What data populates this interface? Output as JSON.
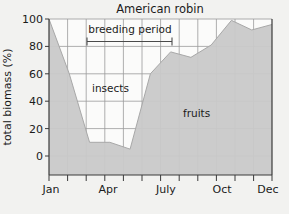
{
  "chart_data": {
    "type": "area",
    "title": "American robin",
    "xlabel": "",
    "ylabel": "total biomass (%)",
    "ylim": [
      0,
      100
    ],
    "yticks": [
      0,
      20,
      40,
      60,
      80,
      100
    ],
    "ytick_labels": [
      "0",
      "20",
      "40",
      "60",
      "80",
      "100"
    ],
    "grid": true,
    "legend_position": "inline-region-labels",
    "categories": [
      "Jan",
      "Feb",
      "Mar",
      "Apr",
      "May",
      "Jun",
      "Jul",
      "Aug",
      "Sep",
      "Oct",
      "Nov",
      "Dec"
    ],
    "xtick_labels": [
      "Jan",
      "Apr",
      "July",
      "Oct",
      "Dec"
    ],
    "xtick_label_months": [
      "Jan",
      "Apr",
      "Jul",
      "Oct",
      "Dec"
    ],
    "series": [
      {
        "name": "fruits",
        "fill": "stacked-bottom",
        "color": "#c9c9c9",
        "values": [
          100,
          60,
          10,
          10,
          5,
          60,
          76,
          72,
          81,
          99,
          92,
          96
        ]
      },
      {
        "name": "insects",
        "fill": "stacked-top",
        "color": "#fbfbfa",
        "values": [
          0,
          40,
          90,
          90,
          95,
          40,
          24,
          28,
          19,
          1,
          8,
          4
        ]
      }
    ],
    "region_labels": [
      {
        "text": "insects",
        "x_month": "Mar",
        "y_value": 52
      },
      {
        "text": "fruits",
        "x_month": "Sep",
        "y_value": 33
      }
    ],
    "annotations": [
      {
        "name": "breeding-period",
        "text": "breeding period",
        "start_month": "Mar",
        "end_month": "Jul",
        "y_value": 85,
        "style": "range-bar-with-end-caps"
      }
    ],
    "colors": {
      "background": "#f2f2f0",
      "plot_background": "#fbfbfa",
      "fruits_fill": "#c9c9c9",
      "insects_fill": "#fbfbfa",
      "grid": "#9a9a9a",
      "axis": "#3a3a3a",
      "text": "#1b1b1b"
    }
  }
}
